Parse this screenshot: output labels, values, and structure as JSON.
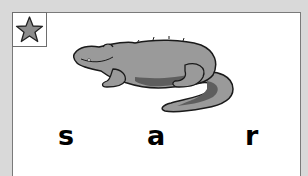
{
  "card": {
    "star_icon": "star-icon",
    "image": "crocodile-illustration",
    "letters": [
      "s",
      "a",
      "r"
    ]
  },
  "colors": {
    "background": "#d9d9d9",
    "card": "#ffffff",
    "border": "#7a7a7a",
    "star_fill": "#8c8c8c",
    "croc_body": "#9a9a9a",
    "croc_dark": "#5e5e5e",
    "outline": "#1a1a1a"
  }
}
